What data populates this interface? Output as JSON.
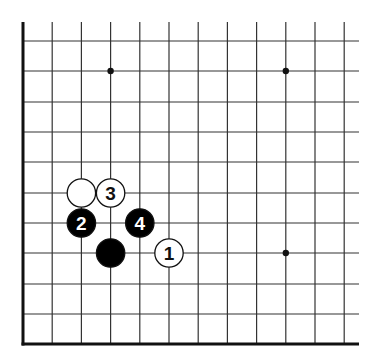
{
  "diagram": {
    "type": "go-board-corner",
    "corner": "bottom-left",
    "visible_columns": 12,
    "visible_rows": 11,
    "colors": {
      "background": "#ffffff",
      "grid_line": "#333333",
      "edge_line": "#111111",
      "black_stone": "#000000",
      "white_stone": "#ffffff",
      "stone_outline": "#111111"
    },
    "star_points": [
      {
        "col": 3,
        "row": 1
      },
      {
        "col": 9,
        "row": 1
      },
      {
        "col": 9,
        "row": 7
      }
    ],
    "stones": [
      {
        "color": "white",
        "col": 2,
        "row": 5,
        "label": ""
      },
      {
        "color": "white",
        "col": 3,
        "row": 5,
        "label": "3"
      },
      {
        "color": "black",
        "col": 2,
        "row": 6,
        "label": "2"
      },
      {
        "color": "black",
        "col": 4,
        "row": 6,
        "label": "4"
      },
      {
        "color": "black",
        "col": 3,
        "row": 7,
        "label": ""
      },
      {
        "color": "white",
        "col": 5,
        "row": 7,
        "label": "1"
      }
    ]
  }
}
